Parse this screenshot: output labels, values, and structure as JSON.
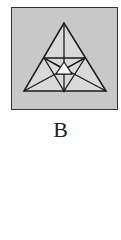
{
  "figure": {
    "label": "B",
    "panel": {
      "x": 11,
      "y": 7,
      "width": 107,
      "height": 103,
      "fill": "#c8c8c8",
      "stroke": "#333333"
    },
    "colors": {
      "line": "#1a1a1a",
      "outer_fill": "#d9d9d9",
      "inner_fill": "#f5f5f5"
    },
    "outer_triangle": [
      [
        64,
        23
      ],
      [
        24,
        91
      ],
      [
        106,
        91
      ]
    ],
    "midpoint_triangle": [
      [
        44,
        58
      ],
      [
        85,
        58
      ],
      [
        64,
        91
      ]
    ],
    "center_triangle": [
      [
        64,
        62
      ],
      [
        56,
        74
      ],
      [
        72,
        74
      ]
    ],
    "center_point": [
      64,
      74
    ]
  }
}
